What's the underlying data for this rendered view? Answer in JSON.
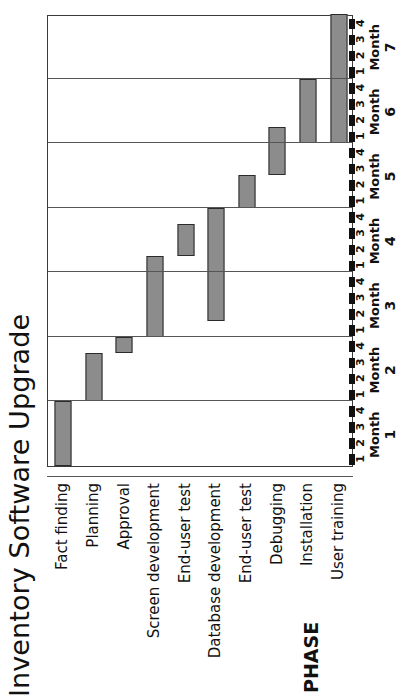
{
  "chart_title": "Inventory Software Upgrade",
  "phase_header": "PHASE",
  "axis": {
    "month_label": "Month",
    "months": [
      "1",
      "2",
      "3",
      "4",
      "5",
      "6",
      "7"
    ],
    "weeks": [
      "1",
      "2",
      "3",
      "4"
    ],
    "total_weeks": 28
  },
  "chart_data": {
    "type": "bar",
    "title": "Inventory Software Upgrade",
    "xlabel": "Month",
    "ylabel": "PHASE",
    "orientation": "horizontal-gantt",
    "x_unit": "week",
    "xlim": [
      0,
      28
    ],
    "grid": "vertical month boundaries",
    "legend": "none",
    "categories": [
      "Fact finding",
      "Planning",
      "Approval",
      "Screen development",
      "End-user test",
      "Database development",
      "End-user test",
      "Debugging",
      "Installation",
      "User training"
    ],
    "tasks": [
      {
        "phase": "Fact finding",
        "start_week": 0,
        "end_week": 4,
        "start_label": "Month 1 week 1",
        "end_label": "Month 1 week 4"
      },
      {
        "phase": "Planning",
        "start_week": 4,
        "end_week": 7,
        "start_label": "Month 2 week 1",
        "end_label": "Month 2 week 3"
      },
      {
        "phase": "Approval",
        "start_week": 7,
        "end_week": 8,
        "start_label": "Month 2 week 4",
        "end_label": "Month 2 week 4"
      },
      {
        "phase": "Screen development",
        "start_week": 8,
        "end_week": 13,
        "start_label": "Month 3 week 1",
        "end_label": "Month 4 week 1"
      },
      {
        "phase": "End-user test",
        "start_week": 13,
        "end_week": 15,
        "start_label": "Month 4 week 2",
        "end_label": "Month 4 week 3"
      },
      {
        "phase": "Database development",
        "start_week": 9,
        "end_week": 16,
        "start_label": "Month 3 week 2",
        "end_label": "Month 4 week 4"
      },
      {
        "phase": "End-user test",
        "start_week": 16,
        "end_week": 18,
        "start_label": "Month 5 week 1",
        "end_label": "Month 5 week 2"
      },
      {
        "phase": "Debugging",
        "start_week": 18,
        "end_week": 21,
        "start_label": "Month 5 week 3",
        "end_label": "Month 6 week 1"
      },
      {
        "phase": "Installation",
        "start_week": 20,
        "end_week": 24,
        "start_label": "Month 6 week 1",
        "end_label": "Month 6 week 4"
      },
      {
        "phase": "User training",
        "start_week": 20,
        "end_week": 28,
        "start_label": "Month 6 week 1",
        "end_label": "Month 7 week 4"
      }
    ]
  },
  "style": {
    "bar_fill": "#8c8c8c",
    "bar_border": "#2b2b2b",
    "grid_color": "#555555",
    "frame_color": "#3a3a3a",
    "text_color": "#111111",
    "background": "#ffffff"
  }
}
